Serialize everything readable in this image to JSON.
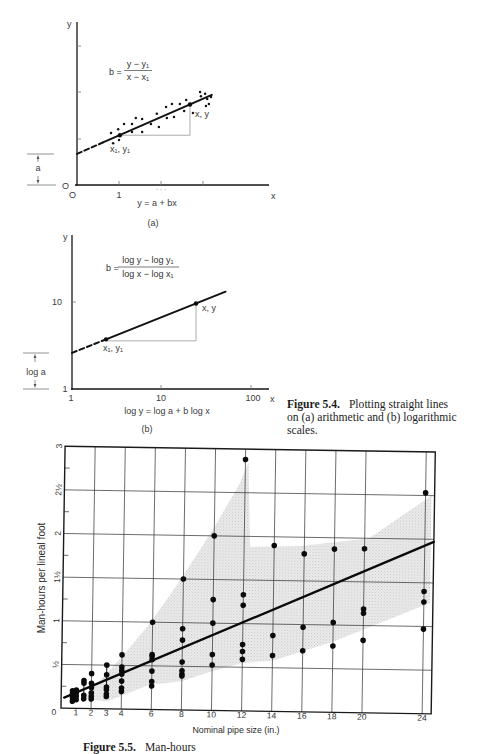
{
  "captions": {
    "figure_5_4": {
      "label": "Figure 5.4.",
      "line1": "Plotting straight lines",
      "line2": "on (a) arithmetic and (b) logarithmic",
      "line3": "scales."
    },
    "figure_5_5_partial": {
      "label": "Figure 5.5.",
      "text": "Man-hours"
    }
  },
  "chart_data": [
    {
      "id": "figure-5-4a",
      "type": "scatter",
      "title": "",
      "panel_label": "(a)",
      "xlabel": "x",
      "ylabel": "y",
      "x_scale": "linear",
      "y_scale": "linear",
      "xlim": [
        0,
        4.6
      ],
      "ylim": [
        0,
        3.5
      ],
      "x_ticks": [
        1,
        2,
        3
      ],
      "y_ticks": [
        1,
        2,
        3
      ],
      "origin_y_label": "O",
      "origin_x_label": "O",
      "x_tick_labels": [
        {
          "x": 1,
          "label": "1"
        },
        {
          "x": 2,
          "label": "· · ·"
        }
      ],
      "formula": {
        "lhs": "b =",
        "numerator": "y − y₁",
        "denominator": "x − x₁"
      },
      "equation": "y = a + bx",
      "intercept_label": "a",
      "fit": {
        "intercept_a": 0.67,
        "slope_b": 0.395,
        "dashed_x": [
          0,
          0.62
        ],
        "solid_x": [
          0.62,
          3.21
        ]
      },
      "marked_points": [
        {
          "label": "x₁, y₁",
          "x": 1.02,
          "y": 1.07
        },
        {
          "label": "x, y",
          "x": 2.69,
          "y": 1.73
        }
      ],
      "points": [
        [
          0.81,
          1.12
        ],
        [
          0.86,
          0.9
        ],
        [
          0.98,
          1.2
        ],
        [
          1.0,
          0.97
        ],
        [
          1.12,
          1.31
        ],
        [
          1.31,
          1.31
        ],
        [
          1.31,
          1.14
        ],
        [
          1.4,
          1.44
        ],
        [
          1.55,
          1.42
        ],
        [
          1.55,
          1.14
        ],
        [
          1.76,
          1.31
        ],
        [
          1.9,
          1.53
        ],
        [
          1.95,
          1.25
        ],
        [
          2.12,
          1.68
        ],
        [
          2.14,
          1.44
        ],
        [
          2.26,
          1.74
        ],
        [
          2.31,
          1.46
        ],
        [
          2.45,
          1.74
        ],
        [
          2.55,
          1.59
        ],
        [
          2.6,
          1.83
        ],
        [
          2.76,
          1.55
        ],
        [
          2.93,
          2.0
        ],
        [
          2.95,
          1.91
        ],
        [
          3.05,
          1.96
        ],
        [
          3.1,
          1.85
        ],
        [
          3.07,
          1.7
        ],
        [
          3.14,
          1.74
        ],
        [
          3.19,
          1.89
        ]
      ]
    },
    {
      "id": "figure-5-4b",
      "type": "line",
      "title": "",
      "panel_label": "(b)",
      "xlabel": "x",
      "ylabel": "y",
      "x_scale": "log",
      "y_scale": "log",
      "xlim": [
        1,
        160
      ],
      "ylim": [
        1,
        62
      ],
      "x_ticks": [
        1,
        10,
        100
      ],
      "x_tick_labels": [
        "1",
        "10",
        "100"
      ],
      "y_ticks": [
        1,
        10
      ],
      "y_tick_labels": [
        "1",
        "10"
      ],
      "formula": {
        "lhs": "b =",
        "numerator": "log y − log y₁",
        "denominator": "log x − log x₁"
      },
      "equation": "log y = log a + b log x",
      "intercept_label": "log a",
      "fit": {
        "a": 2.6,
        "b": 0.41,
        "dashed_x": [
          1,
          2.4
        ],
        "solid_x": [
          2.4,
          52
        ]
      },
      "marked_points": [
        {
          "label": "x₁, y₁",
          "x": 2.4,
          "y": 3.72
        },
        {
          "label": "x, y",
          "x": 24.3,
          "y": 9.6
        }
      ]
    },
    {
      "id": "figure-5-5",
      "type": "scatter",
      "title": "",
      "xlabel": "Nominal pipe size (in.)",
      "ylabel": "Man-hours per lineal foot",
      "xlim": [
        0,
        24.6
      ],
      "ylim": [
        0,
        3
      ],
      "grid": true,
      "x_ticks": [
        0,
        1,
        2,
        3,
        4,
        6,
        8,
        10,
        12,
        14,
        16,
        18,
        20,
        24
      ],
      "x_tick_labels": [
        "0",
        "1",
        "2",
        "3",
        "4",
        "6",
        "8",
        "10",
        "12",
        "14",
        "16",
        "18",
        "20",
        "24"
      ],
      "y_ticks": [
        0.5,
        1,
        1.5,
        2,
        2.5,
        3
      ],
      "y_tick_labels": [
        "½",
        "1",
        "1½",
        "2",
        "2½",
        "3"
      ],
      "y_minor_ticks": [
        0.25,
        0.75,
        1.25,
        1.75,
        2.25,
        2.75
      ],
      "x_grid": [
        2,
        4,
        6,
        8,
        10,
        12,
        14,
        16,
        18,
        20,
        24
      ],
      "y_grid": [
        0.5,
        1,
        1.5,
        2,
        2.5
      ],
      "columns": [
        {
          "x": 0.75,
          "y": [
            0.08,
            0.12,
            0.17,
            0.2
          ]
        },
        {
          "x": 1,
          "y": [
            0.1,
            0.14,
            0.18,
            0.21
          ]
        },
        {
          "x": 1.5,
          "y": [
            0.11,
            0.15,
            0.29,
            0.32
          ]
        },
        {
          "x": 2,
          "y": [
            0.11,
            0.14,
            0.18,
            0.24,
            0.29,
            0.4
          ]
        },
        {
          "x": 3,
          "y": [
            0.14,
            0.17,
            0.22,
            0.25,
            0.39,
            0.5
          ]
        },
        {
          "x": 4,
          "y": [
            0.2,
            0.24,
            0.32,
            0.4,
            0.44,
            0.48,
            0.62
          ]
        },
        {
          "x": 6,
          "y": [
            0.27,
            0.32,
            0.44,
            0.57,
            0.61,
            0.63,
            1.0
          ]
        },
        {
          "x": 8,
          "y": [
            0.39,
            0.41,
            0.45,
            0.55,
            0.8,
            0.93,
            1.5
          ]
        },
        {
          "x": 10,
          "y": [
            0.52,
            0.64,
            1.0,
            1.27,
            2.0
          ]
        },
        {
          "x": 12,
          "y": [
            0.59,
            0.68,
            0.76,
            1.21,
            1.33,
            2.88
          ]
        },
        {
          "x": 14,
          "y": [
            0.64,
            0.87,
            1.9
          ]
        },
        {
          "x": 16,
          "y": [
            0.7,
            0.97,
            1.81
          ]
        },
        {
          "x": 18,
          "y": [
            0.76,
            1.03,
            1.87
          ]
        },
        {
          "x": 20,
          "y": [
            0.83,
            1.14,
            1.19,
            1.88
          ]
        },
        {
          "x": 24,
          "y": [
            0.97,
            1.28,
            1.4,
            2.53
          ]
        }
      ],
      "trend_line": {
        "x": [
          0.2,
          24.6
        ],
        "y": [
          0.12,
          1.97
        ]
      },
      "shaded_band": [
        [
          1.5,
          0.12
        ],
        [
          4,
          0.6
        ],
        [
          5.8,
          0.98
        ],
        [
          7.3,
          1.36
        ],
        [
          8.9,
          1.79
        ],
        [
          10.2,
          2.16
        ],
        [
          11.6,
          2.59
        ],
        [
          12.2,
          2.85
        ],
        [
          12.4,
          1.88
        ],
        [
          15.8,
          1.9
        ],
        [
          20.3,
          2.0
        ],
        [
          22.5,
          2.27
        ],
        [
          24.4,
          2.5
        ],
        [
          24.4,
          1.27
        ],
        [
          18,
          0.81
        ],
        [
          14,
          0.58
        ],
        [
          12,
          0.55
        ],
        [
          10,
          0.45
        ],
        [
          8,
          0.33
        ],
        [
          5.8,
          0.28
        ],
        [
          3,
          0.08
        ]
      ]
    }
  ]
}
